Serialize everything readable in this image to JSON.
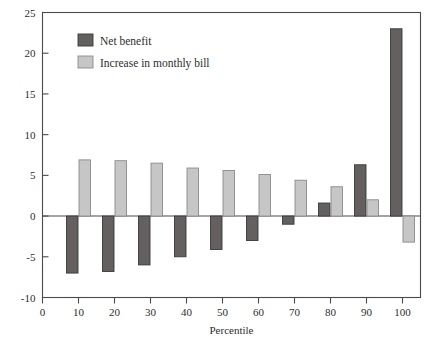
{
  "chart_data": {
    "type": "bar",
    "title": "",
    "subtitle": "",
    "xlabel": "Percentile",
    "ylabel": "",
    "xlim": [
      0,
      105
    ],
    "ylim": [
      -10,
      25
    ],
    "grid": false,
    "legend_position": "top-left",
    "xticks": [
      0,
      10,
      20,
      30,
      40,
      50,
      60,
      70,
      80,
      90,
      100
    ],
    "xtick_labels": [
      "0",
      "10",
      "20",
      "30",
      "40",
      "50",
      "60",
      "70",
      "80",
      "90",
      "100"
    ],
    "yticks": [
      -10,
      -5,
      0,
      5,
      10,
      15,
      20,
      25
    ],
    "ytick_labels": [
      "-10",
      "-5",
      "0",
      "5",
      "10",
      "15",
      "20",
      "25"
    ],
    "categories": [
      10,
      20,
      30,
      40,
      50,
      60,
      70,
      80,
      90,
      100
    ],
    "series": [
      {
        "name": "Net benefit",
        "color": "#63605f",
        "edge_color": "#3a3838",
        "values": [
          -7.0,
          -6.8,
          -6.0,
          -5.0,
          -4.1,
          -3.0,
          -1.0,
          1.6,
          6.3,
          23.0
        ]
      },
      {
        "name": "Increase in monthly bill",
        "color": "#c6c6c6",
        "edge_color": "#8a8a8a",
        "values": [
          6.9,
          6.8,
          6.5,
          5.9,
          5.6,
          5.1,
          4.4,
          3.6,
          2.0,
          -3.2
        ]
      }
    ]
  },
  "legend": {
    "entries": [
      {
        "label": "Net benefit",
        "swatch": "#63605f"
      },
      {
        "label": "Increase in monthly bill",
        "swatch": "#c6c6c6"
      }
    ]
  },
  "axes": {
    "x_title": "Percentile",
    "y_title": ""
  }
}
